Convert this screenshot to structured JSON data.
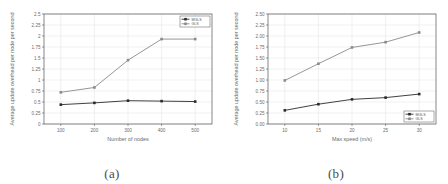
{
  "figure": {
    "panels": [
      {
        "caption": "(a)",
        "name": "panel-a",
        "chart_data": {
          "type": "line",
          "title": "",
          "xlabel": "Number of nodes",
          "ylabel": "Average update overhead per node per second",
          "x": [
            100,
            200,
            300,
            400,
            500
          ],
          "xticklabels": [
            "100",
            "200",
            "300",
            "400",
            "500"
          ],
          "yticklabels": [
            "0",
            "0.25",
            "0.5",
            "0.75",
            "1",
            "1.25",
            "1.5",
            "1.75",
            "2",
            "2.25",
            "2.5"
          ],
          "yticks": [
            0,
            0.25,
            0.5,
            0.75,
            1,
            1.25,
            1.5,
            1.75,
            2,
            2.25,
            2.5
          ],
          "xlim": [
            50,
            550
          ],
          "ylim": [
            0,
            2.5
          ],
          "grid": true,
          "legend_position": "top-right",
          "series": [
            {
              "name": "MGLS",
              "color": "#2b2b2b",
              "values": [
                0.44,
                0.48,
                0.53,
                0.52,
                0.51
              ]
            },
            {
              "name": "GLS",
              "color": "#8a8a8a",
              "values": [
                0.72,
                0.83,
                1.45,
                1.93,
                1.93
              ]
            }
          ]
        }
      },
      {
        "caption": "(b)",
        "name": "panel-b",
        "chart_data": {
          "type": "line",
          "title": "",
          "xlabel": "Max speed (m/s)",
          "ylabel": "Average update overhead per node per second",
          "x": [
            10,
            15,
            20,
            25,
            30
          ],
          "xticklabels": [
            "10",
            "15",
            "20",
            "25",
            "30"
          ],
          "yticklabels": [
            "0.00",
            "0.25",
            "0.50",
            "0.75",
            "1.00",
            "1.25",
            "1.50",
            "1.75",
            "2.00",
            "2.25",
            "2.50"
          ],
          "yticks": [
            0,
            0.25,
            0.5,
            0.75,
            1,
            1.25,
            1.5,
            1.75,
            2,
            2.25,
            2.5
          ],
          "xlim": [
            7.5,
            32.5
          ],
          "ylim": [
            0,
            2.5
          ],
          "grid": true,
          "legend_position": "bottom-right",
          "series": [
            {
              "name": "MGLS",
              "color": "#2b2b2b",
              "values": [
                0.31,
                0.45,
                0.56,
                0.6,
                0.68
              ]
            },
            {
              "name": "GLS",
              "color": "#8a8a8a",
              "values": [
                0.99,
                1.37,
                1.74,
                1.86,
                2.08
              ]
            }
          ]
        }
      }
    ]
  }
}
